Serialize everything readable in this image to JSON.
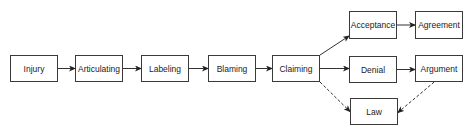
{
  "diagram": {
    "type": "flowchart",
    "nodes": [
      {
        "id": "injury",
        "label": "Injury",
        "x": 10,
        "y": 55,
        "w": 48,
        "h": 27
      },
      {
        "id": "articulating",
        "label": "Articulating",
        "x": 75,
        "y": 55,
        "w": 48,
        "h": 27
      },
      {
        "id": "labeling",
        "label": "Labeling",
        "x": 141,
        "y": 55,
        "w": 48,
        "h": 27
      },
      {
        "id": "blaming",
        "label": "Blaming",
        "x": 208,
        "y": 55,
        "w": 48,
        "h": 27
      },
      {
        "id": "claiming",
        "label": "Claiming",
        "x": 272,
        "y": 55,
        "w": 48,
        "h": 27
      },
      {
        "id": "acceptance",
        "label": "Acceptance",
        "x": 349,
        "y": 11,
        "w": 48,
        "h": 28
      },
      {
        "id": "agreement",
        "label": "Agreement",
        "x": 415,
        "y": 11,
        "w": 48,
        "h": 28
      },
      {
        "id": "denial",
        "label": "Denial",
        "x": 349,
        "y": 56,
        "w": 48,
        "h": 27
      },
      {
        "id": "argument",
        "label": "Argument",
        "x": 415,
        "y": 55,
        "w": 48,
        "h": 27
      },
      {
        "id": "law",
        "label": "Law",
        "x": 350,
        "y": 98,
        "w": 48,
        "h": 27
      }
    ],
    "edges": [
      {
        "from": "injury",
        "to": "articulating",
        "style": "solid"
      },
      {
        "from": "articulating",
        "to": "labeling",
        "style": "solid"
      },
      {
        "from": "labeling",
        "to": "blaming",
        "style": "solid"
      },
      {
        "from": "blaming",
        "to": "claiming",
        "style": "solid"
      },
      {
        "from": "claiming",
        "to": "acceptance",
        "style": "solid"
      },
      {
        "from": "claiming",
        "to": "denial",
        "style": "solid"
      },
      {
        "from": "claiming",
        "to": "law",
        "style": "dashed"
      },
      {
        "from": "acceptance",
        "to": "agreement",
        "style": "solid"
      },
      {
        "from": "denial",
        "to": "argument",
        "style": "solid"
      },
      {
        "from": "argument",
        "to": "law",
        "style": "dashed"
      }
    ],
    "colors": {
      "line": "#333333",
      "border": "#3a3a3a",
      "text": "#222222",
      "background": "#ffffff"
    }
  }
}
